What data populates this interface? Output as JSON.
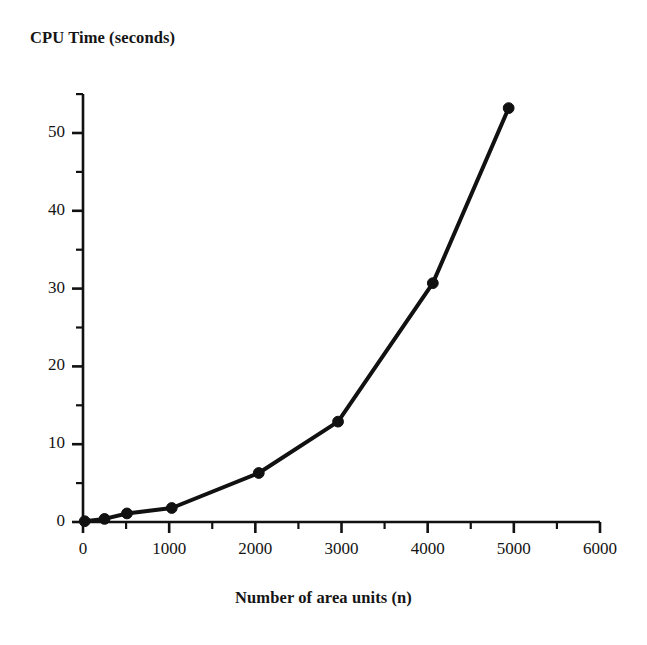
{
  "chart_data": {
    "type": "line",
    "title": "",
    "xlabel": "Number of area units (n)",
    "ylabel": "CPU Time (seconds)",
    "xlim": [
      0,
      6000
    ],
    "ylim": [
      0,
      55
    ],
    "xticks": [
      0,
      1000,
      2000,
      3000,
      4000,
      5000,
      6000
    ],
    "xtick_labels": [
      "0",
      "1000",
      "2000",
      "3000",
      "4000",
      "5000",
      "6000"
    ],
    "yticks": [
      0,
      10,
      20,
      30,
      40,
      50
    ],
    "ytick_labels": [
      "0",
      "10",
      "20",
      "30",
      "40",
      "50"
    ],
    "x_minor_tick_step": 500,
    "y_minor_tick_step": 5,
    "grid": false,
    "legend": null,
    "marker": "filled-circle",
    "line_color": "#111111",
    "marker_color": "#111111",
    "line_width_px": 4,
    "x": [
      20,
      250,
      510,
      1030,
      2040,
      2960,
      4060,
      4940
    ],
    "y": [
      0.1,
      0.4,
      1.1,
      1.8,
      6.3,
      12.9,
      30.7,
      53.2
    ],
    "series": [
      {
        "name": "CPU time",
        "points": [
          {
            "x": 20,
            "y": 0.1
          },
          {
            "x": 250,
            "y": 0.4
          },
          {
            "x": 510,
            "y": 1.1
          },
          {
            "x": 1030,
            "y": 1.8
          },
          {
            "x": 2040,
            "y": 6.3
          },
          {
            "x": 2960,
            "y": 12.9
          },
          {
            "x": 4060,
            "y": 30.7
          },
          {
            "x": 4940,
            "y": 53.2
          }
        ]
      }
    ]
  },
  "figure": {
    "background_color": "#ffffff",
    "axis_color": "#111111"
  }
}
